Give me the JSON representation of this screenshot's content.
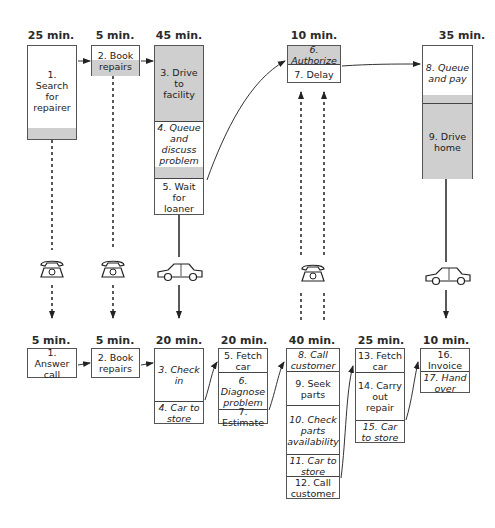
{
  "diagram": {
    "title": "",
    "customer_process": {
      "columns": [
        {
          "time": "25 min.",
          "steps": [
            {
              "label": "1. Search for repairer",
              "shade": "white_with_grey_bottom"
            }
          ]
        },
        {
          "time": "5 min.",
          "steps": [
            {
              "label": "2. Book repairs",
              "shade": "white_top_grey_bottom"
            }
          ]
        },
        {
          "time": "45 min.",
          "steps": [
            {
              "label": "3. Drive to facility",
              "shade": "grey"
            },
            {
              "label": "4. Queue and discuss problem",
              "shade": "white_with_grey_bottom"
            },
            {
              "label": "5. Wait for loaner",
              "shade": "white"
            }
          ]
        },
        {
          "time": "10 min.",
          "steps": [
            {
              "label": "6. Authorize",
              "shade": "grey"
            },
            {
              "label": "7. Delay",
              "shade": "white"
            }
          ]
        },
        {
          "time": "35 min.",
          "steps": [
            {
              "label": "8. Queue and pay",
              "shade": "white_with_grey_bottom"
            },
            {
              "label": "9. Drive home",
              "shade": "grey"
            }
          ]
        }
      ]
    },
    "connectors": [
      {
        "from": "customer.1",
        "to": "provider.1",
        "type": "dashed",
        "icon": "telephone"
      },
      {
        "from": "customer.2",
        "to": "provider.2",
        "type": "dashed",
        "icon": "telephone"
      },
      {
        "from": "customer.5",
        "to": "provider.3",
        "type": "solid",
        "icon": "car"
      },
      {
        "from": "provider.8-12",
        "to": "customer.6-7",
        "type": "dashed-double-up",
        "icon": "telephone"
      },
      {
        "from": "customer.9",
        "to": "provider.16",
        "type": "solid",
        "icon": "car"
      }
    ],
    "provider_process": {
      "columns": [
        {
          "time": "5 min.",
          "steps": [
            {
              "label": "1. Answer call"
            }
          ]
        },
        {
          "time": "5 min.",
          "steps": [
            {
              "label": "2. Book repairs"
            }
          ]
        },
        {
          "time": "20 min.",
          "steps": [
            {
              "label": "3. Check in"
            },
            {
              "label": "4. Car to store"
            }
          ]
        },
        {
          "time": "20 min.",
          "steps": [
            {
              "label": "5. Fetch car"
            },
            {
              "label": "6. Diagnose problem"
            },
            {
              "label": "7. Estimate"
            }
          ]
        },
        {
          "time": "40 min.",
          "steps": [
            {
              "label": "8. Call customer"
            },
            {
              "label": "9. Seek parts"
            },
            {
              "label": "10. Check parts availability"
            },
            {
              "label": "11. Car to store"
            },
            {
              "label": "12. Call customer"
            }
          ]
        },
        {
          "time": "25 min.",
          "steps": [
            {
              "label": "13. Fetch car"
            },
            {
              "label": "14. Carry out repair"
            },
            {
              "label": "15. Car to store"
            }
          ]
        },
        {
          "time": "10 min.",
          "steps": [
            {
              "label": "16. Invoice"
            },
            {
              "label": "17. Hand over"
            }
          ]
        }
      ]
    }
  },
  "top": {
    "t1": "25 min.",
    "t2": "5 min.",
    "t3": "45 min.",
    "t4": "10 min.",
    "t5": "35 min.",
    "s1": "1. Search for repairer",
    "s2": "2. Book repairs",
    "s3": "3. Drive to facility",
    "s4": "4. Queue and discuss problem",
    "s5": "5. Wait for loaner",
    "s6": "6. Authorize",
    "s7": "7. Delay",
    "s8": "8. Queue and pay",
    "s9": "9. Drive home"
  },
  "bottom": {
    "t1": "5 min.",
    "t2": "5 min.",
    "t3": "20 min.",
    "t4": "20 min.",
    "t5": "40 min.",
    "t6": "25 min.",
    "t7": "10 min.",
    "s1": "1. Answer call",
    "s2": "2. Book repairs",
    "s3": "3. Check in",
    "s4": "4. Car to store",
    "s5": "5. Fetch car",
    "s6": "6. Diagnose problem",
    "s7": "7. Estimate",
    "s8": "8. Call customer",
    "s9": "9. Seek parts",
    "s10": "10. Check parts availability",
    "s11": "11. Car to store",
    "s12": "12. Call customer",
    "s13": "13. Fetch car",
    "s14": "14. Carry out repair",
    "s15": "15. Car to store",
    "s16": "16. Invoice",
    "s17": "17. Hand over"
  },
  "icons": {
    "phone1": "telephone-icon",
    "phone2": "telephone-icon",
    "phone3": "telephone-icon",
    "car1": "car-icon",
    "car2": "car-icon"
  }
}
